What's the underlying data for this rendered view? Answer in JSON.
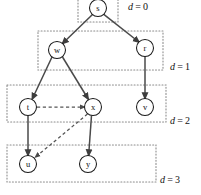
{
  "figure": {
    "width": 201,
    "height": 195,
    "background_color": "#ffffff",
    "node_fill_color": "#ffffff",
    "node_stroke_color": "#1a1a1a",
    "solid_edge_color": "#4a4a4a",
    "dashed_edge_color": "#555555",
    "level_box_color": "#8c8c8c"
  },
  "nodes": [
    {
      "id": "s",
      "label": "s",
      "cx": 98,
      "cy": 8,
      "r": 8.5,
      "level": 0
    },
    {
      "id": "w",
      "label": "w",
      "cx": 57,
      "cy": 50,
      "r": 8.5,
      "level": 1
    },
    {
      "id": "r",
      "label": "r",
      "cx": 145,
      "cy": 48,
      "r": 8.5,
      "level": 1
    },
    {
      "id": "t",
      "label": "t",
      "cx": 28,
      "cy": 107,
      "r": 8.5,
      "level": 2
    },
    {
      "id": "x",
      "label": "x",
      "cx": 93,
      "cy": 107,
      "r": 8.5,
      "level": 2
    },
    {
      "id": "v",
      "label": "v",
      "cx": 145,
      "cy": 107,
      "r": 8.5,
      "level": 2
    },
    {
      "id": "u",
      "label": "u",
      "cx": 28,
      "cy": 164,
      "r": 8.5,
      "level": 3
    },
    {
      "id": "y",
      "label": "y",
      "cx": 88,
      "cy": 164,
      "r": 8.5,
      "level": 3
    }
  ],
  "edges": [
    {
      "id": "s-w",
      "from": "s",
      "to": "w",
      "style": "solid",
      "arrow": true
    },
    {
      "id": "s-r",
      "from": "s",
      "to": "r",
      "style": "solid",
      "arrow": true
    },
    {
      "id": "w-t",
      "from": "w",
      "to": "t",
      "style": "solid",
      "arrow": true
    },
    {
      "id": "w-x",
      "from": "w",
      "to": "x",
      "style": "solid",
      "arrow": true
    },
    {
      "id": "r-v",
      "from": "r",
      "to": "v",
      "style": "solid",
      "arrow": true
    },
    {
      "id": "t-u",
      "from": "t",
      "to": "u",
      "style": "solid",
      "arrow": true
    },
    {
      "id": "x-y",
      "from": "x",
      "to": "y",
      "style": "solid",
      "arrow": true
    },
    {
      "id": "t-x",
      "from": "t",
      "to": "x",
      "style": "dashed",
      "arrow": true
    },
    {
      "id": "x-u",
      "from": "x",
      "to": "u",
      "style": "dashed",
      "arrow": true
    }
  ],
  "levels": [
    {
      "id": "level-0",
      "label_var": "d",
      "label_eq": "=",
      "label_value": "0",
      "label_x": 128,
      "label_y": 8,
      "box": {
        "x": 78,
        "y": -4,
        "width": 40,
        "height": 26
      }
    },
    {
      "id": "level-1",
      "label_var": "d",
      "label_eq": "=",
      "label_value": "1",
      "label_x": 170,
      "label_y": 68,
      "box": {
        "x": 38,
        "y": 31,
        "width": 125,
        "height": 39
      }
    },
    {
      "id": "level-2",
      "label_var": "d",
      "label_eq": "=",
      "label_value": "2",
      "label_x": 170,
      "label_y": 122,
      "box": {
        "x": 7,
        "y": 85,
        "width": 159,
        "height": 37
      }
    },
    {
      "id": "level-3",
      "label_var": "d",
      "label_eq": "=",
      "label_value": "3",
      "label_x": 160,
      "label_y": 181,
      "box": {
        "x": 7,
        "y": 145,
        "width": 149,
        "height": 37
      }
    }
  ]
}
